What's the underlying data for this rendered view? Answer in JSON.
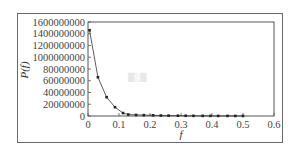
{
  "chart_data": {
    "type": "line",
    "title": "",
    "xlabel": "f",
    "ylabel": "P(f)",
    "xlim": [
      0,
      0.6
    ],
    "ylim": [
      0,
      1600000000
    ],
    "x_ticks": [
      "0",
      "0.1",
      "0.2",
      "0.3",
      "0.4",
      "0.5",
      "0.6"
    ],
    "y_ticks": [
      "0",
      "20000000",
      "40000000",
      "60000000",
      "80000000",
      "1000000000",
      "1200000000",
      "1400000000",
      "1600000000"
    ],
    "grid": false,
    "legend": null,
    "series": [
      {
        "name": "P(f)",
        "marker": "square",
        "x": [
          0.005,
          0.032,
          0.06,
          0.087,
          0.113,
          0.13,
          0.155,
          0.18,
          0.21,
          0.235,
          0.26,
          0.29,
          0.315,
          0.34,
          0.37,
          0.395,
          0.42,
          0.45,
          0.475,
          0.5
        ],
        "values": [
          1460000000,
          660000000,
          320000000,
          150000000,
          50000000,
          25000000,
          18000000,
          15000000,
          12000000,
          8000000,
          6000000,
          5000000,
          4000000,
          3000000,
          2500000,
          2000000,
          1500000,
          1200000,
          1000000,
          800000
        ]
      }
    ],
    "watermark": "faded text"
  }
}
